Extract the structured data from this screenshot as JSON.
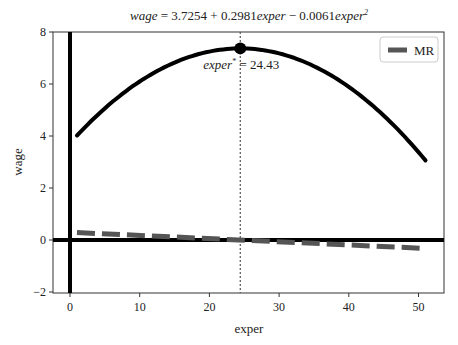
{
  "chart_data": {
    "type": "line",
    "title_parts": {
      "lhs": "wage",
      "eq": " = 3.7254 + 0.2981",
      "v1": "exper",
      "mid": " − 0.0061",
      "v2": "exper",
      "sup": "2"
    },
    "xlabel": "exper",
    "ylabel": "wage",
    "xlim": [
      -3,
      53
    ],
    "ylim": [
      -2,
      8
    ],
    "xticks": [
      0,
      10,
      20,
      30,
      40,
      50
    ],
    "yticks": [
      -2,
      0,
      2,
      4,
      6,
      8
    ],
    "grid": false,
    "legend": {
      "position": "upper right",
      "entries": [
        "MR"
      ]
    },
    "coefficients": {
      "b0": 3.7254,
      "b1": 0.2981,
      "b2": -0.0061
    },
    "series": [
      {
        "name": "wage",
        "style": "solid",
        "color": "#000000",
        "x": [
          1,
          5,
          10,
          15,
          20,
          24.43,
          30,
          35,
          40,
          45,
          51
        ],
        "values": [
          4.02,
          5.06,
          6.1,
          6.82,
          7.23,
          7.37,
          7.19,
          6.72,
          6.02,
          5.08,
          3.06
        ]
      },
      {
        "name": "MR",
        "style": "dashed",
        "color": "#555555",
        "x": [
          1,
          10,
          20,
          24.43,
          30,
          40,
          51
        ],
        "values": [
          0.286,
          0.176,
          0.054,
          0.0,
          -0.068,
          -0.19,
          -0.324
        ]
      }
    ],
    "reference_lines": [
      {
        "type": "vertical",
        "x": 0,
        "style": "solid",
        "color": "#000000"
      },
      {
        "type": "horizontal",
        "y": 0,
        "style": "solid",
        "color": "#000000"
      },
      {
        "type": "vertical",
        "x": 24.43,
        "style": "dotted",
        "color": "#555555"
      }
    ],
    "annotations": [
      {
        "label": "exper",
        "sup": "*",
        "text": " = 24.43",
        "x": 24.43,
        "y": 7.37,
        "marker": "filled-circle"
      }
    ]
  }
}
